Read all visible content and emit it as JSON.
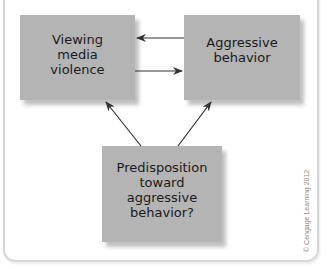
{
  "diagram": {
    "nodes": [
      {
        "id": "media",
        "label": "Viewing\nmedia\nviolence"
      },
      {
        "id": "aggr",
        "label": "Aggressive\nbehavior"
      },
      {
        "id": "predisp",
        "label": "Predisposition\ntoward\naggressive\nbehavior?"
      }
    ],
    "edges": [
      {
        "from": "aggr",
        "to": "media"
      },
      {
        "from": "media",
        "to": "aggr"
      },
      {
        "from": "predisp",
        "to": "media"
      },
      {
        "from": "predisp",
        "to": "aggr"
      }
    ],
    "colors": {
      "box_fill": "#b4b4b4",
      "arrow": "#333333",
      "frame": "#d6d6d6"
    }
  },
  "credit": "© Cengage Learning 2012"
}
